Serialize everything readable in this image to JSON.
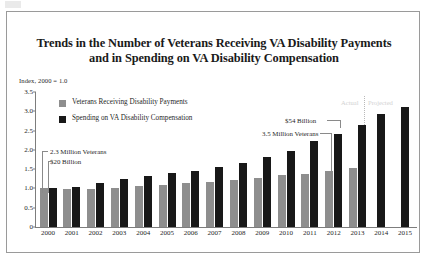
{
  "figure": {
    "title_line1": "Trends in the Number of Veterans Receiving VA Disability Payments",
    "title_line2": "and in Spending on VA Disability Compensation",
    "axis_note": "Index, 2000 = 1.0"
  },
  "faded_labels": {
    "left": "Actual",
    "right": "Projected"
  },
  "annotations": {
    "left_top": "2.3 Million Veterans",
    "left_bottom": "$20 Billion",
    "right_top": "$54 Billion",
    "right_bottom": "3.5 Million Veterans"
  },
  "colors": {
    "veterans": "#8e8e8e",
    "spending": "#181818",
    "frame": "#9a9a9a",
    "axis": "#7d7d7d",
    "divider": "#b9b9b9"
  },
  "chart_data": {
    "type": "bar",
    "title": "Trends in the Number of Veterans Receiving VA Disability Payments and in Spending on VA Disability Compensation",
    "xlabel": "",
    "ylabel": "Index, 2000 = 1.0",
    "ylim": [
      0,
      3.5
    ],
    "yticks": [
      "0",
      "0.5",
      "1.0",
      "1.5",
      "2.0",
      "2.5",
      "3.0",
      "3.5"
    ],
    "ytick_values": [
      0,
      0.5,
      1.0,
      1.5,
      2.0,
      2.5,
      3.0,
      3.5
    ],
    "grid": false,
    "legend_position": "upper-left",
    "categories": [
      "2000",
      "2001",
      "2002",
      "2003",
      "2004",
      "2005",
      "2006",
      "2007",
      "2008",
      "2009",
      "2010",
      "2011",
      "2012",
      "2013",
      "2014",
      "2015"
    ],
    "series": [
      {
        "name": "Veterans Receiving Disability Payments",
        "color": "#8e8e8e",
        "values": [
          1.0,
          0.99,
          0.99,
          1.02,
          1.06,
          1.1,
          1.13,
          1.17,
          1.23,
          1.27,
          1.34,
          1.38,
          1.45,
          1.52,
          null,
          null
        ]
      },
      {
        "name": "Spending on VA Disability Compensation",
        "color": "#181818",
        "values": [
          1.0,
          1.03,
          1.14,
          1.25,
          1.31,
          1.4,
          1.45,
          1.56,
          1.65,
          1.82,
          1.96,
          2.23,
          2.41,
          2.65,
          2.93,
          3.12
        ]
      }
    ],
    "annotations": [
      {
        "text": "2.3 Million Veterans",
        "points_to": "2000 veterans bar"
      },
      {
        "text": "$20 Billion",
        "points_to": "2000 spending bar"
      },
      {
        "text": "$54 Billion",
        "points_to": "2013 spending bar"
      },
      {
        "text": "3.5 Million Veterans",
        "points_to": "2013 veterans bar"
      }
    ]
  }
}
